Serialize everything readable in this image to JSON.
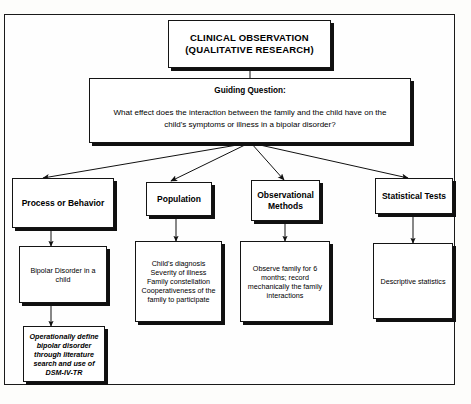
{
  "diagram": {
    "title_box": {
      "label": "CLINICAL OBSERVATION\n(QUALITATIVE RESEARCH)"
    },
    "guiding_question": {
      "heading": "Guiding Question:",
      "text": "What effect does the interaction between the family and the child have on the\nchild's symptoms or illness in a bipolar disorder?"
    },
    "columns": [
      {
        "header": "Process or Behavior",
        "detail": "Bipolar Disorder in a\nchild",
        "extra": "Operationally define\nbipolar disorder\nthrough literature\nsearch and use of\nDSM-IV-TR"
      },
      {
        "header": "Population",
        "detail": "Child's diagnosis\nSeverity of illness\nFamily constellation\nCooperativeness of the\nfamily to participate"
      },
      {
        "header": "Observational\nMethods",
        "detail": "Observe family for 6\nmonths; record\nmechanically the family\ninteractions"
      },
      {
        "header": "Statistical Tests",
        "detail": "Descriptive statistics"
      }
    ],
    "colors": {
      "ink": "#000000",
      "border": "#141414",
      "shadow": "#101010",
      "background": "#ffffff"
    }
  }
}
